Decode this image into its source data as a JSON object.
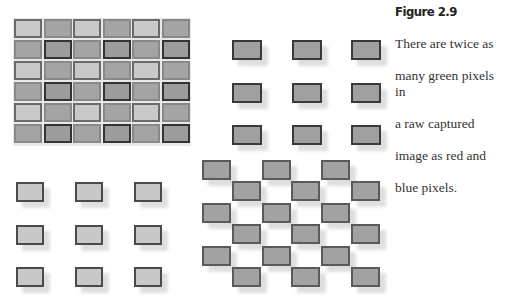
{
  "figure": {
    "title": "Figure 2.9",
    "caption": "There are twice as many green pixels in a raw captured image as red and blue pixels.",
    "caption_lines": [
      "There are twice as",
      "many green pixels in",
      "a raw captured",
      "image as red and",
      "blue pixels."
    ]
  },
  "panels": {
    "bayer_mosaic": {
      "label": "combined mosaic",
      "rows": 6,
      "cols": 6,
      "pattern": [
        [
          "red",
          "green"
        ],
        [
          "green",
          "blue"
        ]
      ]
    },
    "blue_channel": {
      "label": "blue pixels",
      "rows": 3,
      "cols": 3
    },
    "red_channel": {
      "label": "red pixels",
      "rows": 3,
      "cols": 3
    },
    "green_channel": {
      "label": "green pixels",
      "rows": 6,
      "cols": 6,
      "pattern": "checkerboard"
    }
  },
  "colors": {
    "red_cell": "#c9c9c9",
    "green_cell": "#a4a4a4",
    "blue_cell": "#9c9c9c",
    "border_dark": "#333333"
  }
}
